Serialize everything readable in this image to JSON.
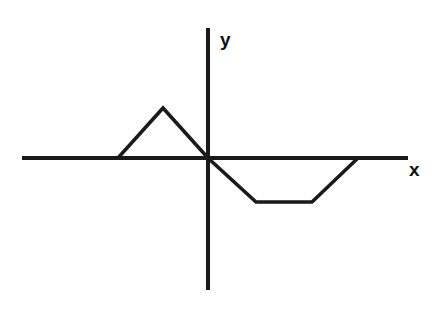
{
  "figure": {
    "background_color": "#ffffff",
    "line_color": "#1a1a1a",
    "width": 444,
    "height": 311
  },
  "axes": {
    "x_axis": {
      "label": "x",
      "label_x": 409,
      "label_y": 176,
      "y_pixel": 158,
      "x_start_pixel": 22,
      "x_end_pixel": 408,
      "stroke_width": 4
    },
    "y_axis": {
      "label": "y",
      "label_x": 220,
      "label_y": 46,
      "x_pixel": 208,
      "y_start_pixel": 28,
      "y_end_pixel": 290,
      "stroke_width": 4
    },
    "origin": {
      "x_pixel": 208,
      "y_pixel": 158
    }
  },
  "chart_data": {
    "type": "line",
    "xlabel": "x",
    "ylabel": "y",
    "grid": false,
    "legend": false,
    "axis_origin_pixel": [
      208,
      158
    ],
    "units_per_pixel_note": "values expressed in pixel coordinates of the source image",
    "series": [
      {
        "name": "f(x)",
        "points_pixel": [
          [
            22,
            158
          ],
          [
            118,
            158
          ],
          [
            163,
            108
          ],
          [
            208,
            158
          ],
          [
            256,
            202
          ],
          [
            312,
            202
          ],
          [
            358,
            158
          ],
          [
            408,
            158
          ]
        ],
        "points_graph": [
          [
            -4.2,
            0
          ],
          [
            -2.0,
            0
          ],
          [
            -1.0,
            1.1
          ],
          [
            0,
            0
          ],
          [
            1.05,
            -0.95
          ],
          [
            2.3,
            -0.95
          ],
          [
            3.3,
            0
          ],
          [
            4.4,
            0
          ]
        ],
        "description": "Zero for x <= -2, rises linearly to a peak at x = -1, falls through the origin, continues down to a flat minimum from x = 1.05 to x = 2.3, rises back to zero at x = 3.3, then stays at zero."
      }
    ],
    "xlim_pixel": [
      22,
      408
    ],
    "ylim_pixel": [
      28,
      290
    ],
    "annotations": []
  }
}
